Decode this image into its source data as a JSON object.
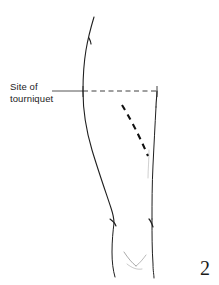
{
  "figure": {
    "domain": "anatomical-line-drawing",
    "background_color": "#ffffff",
    "ink_color": "#1a1a1a",
    "annotation": {
      "label_line_1": "Site of",
      "label_line_2": "tourniquet",
      "leader": {
        "style": "solid-then-dashed",
        "from_x": 52,
        "to_x": 157,
        "y": 91
      }
    },
    "incision_marking": {
      "name": "incision-dashed-curve",
      "style": "dashed",
      "start_x": 122,
      "start_y": 105,
      "end_x": 148,
      "end_y": 156
    },
    "figure_number": "2"
  }
}
